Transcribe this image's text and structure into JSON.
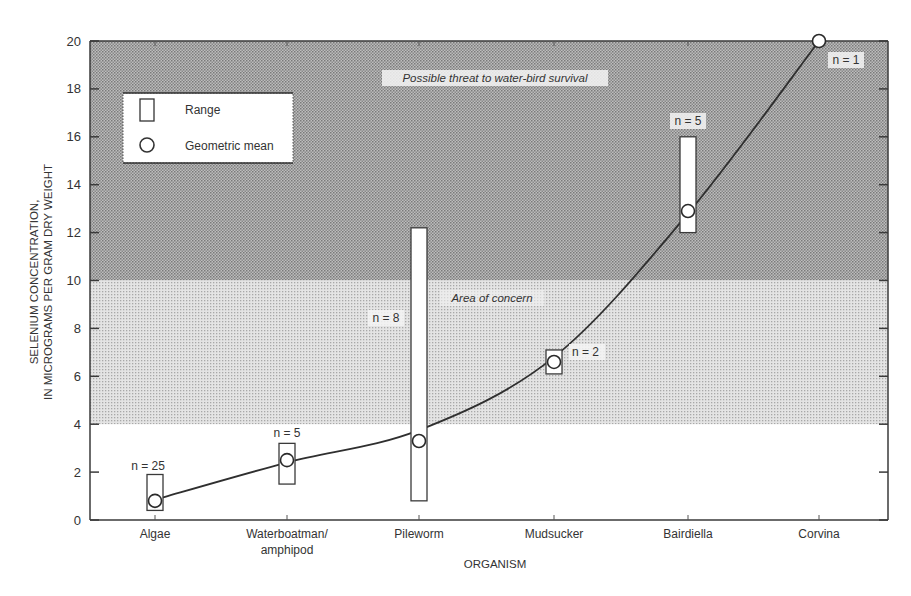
{
  "chart_data": {
    "type": "scatter",
    "title": "",
    "xlabel": "ORGANISM",
    "ylabel_line1": "SELENIUM CONCENTRATION,",
    "ylabel_line2": "IN MICROGRAMS PER GRAM DRY WEIGHT",
    "ylim": [
      0,
      20
    ],
    "yticks": [
      0,
      2,
      4,
      6,
      8,
      10,
      12,
      14,
      16,
      18,
      20
    ],
    "grid": false,
    "categories": [
      "Algae",
      "Waterboatman/\namphipod",
      "Pileworm",
      "Mudsucker",
      "Bairdiella",
      "Corvina"
    ],
    "category_labels": [
      [
        "Algae"
      ],
      [
        "Waterboatman/",
        "amphipod"
      ],
      [
        "Pileworm"
      ],
      [
        "Mudsucker"
      ],
      [
        "Bairdiella"
      ],
      [
        "Corvina"
      ]
    ],
    "series": [
      {
        "name": "Geometric mean",
        "marker": "circle",
        "values": [
          0.8,
          2.5,
          3.3,
          6.6,
          12.9,
          20
        ]
      },
      {
        "name": "Range",
        "marker": "rectangle",
        "low": [
          0.4,
          1.5,
          0.8,
          6.1,
          12.0,
          null
        ],
        "high": [
          1.9,
          3.2,
          12.2,
          7.1,
          16.0,
          null
        ]
      }
    ],
    "sample_sizes": [
      "n = 25",
      "n = 5",
      "n = 8",
      "n = 2",
      "n = 5",
      "n = 1"
    ],
    "trend_curve": {
      "description": "smooth fitted curve through geometric means",
      "points": [
        [
          0,
          0.85
        ],
        [
          1,
          2.4
        ],
        [
          2,
          3.75
        ],
        [
          3,
          6.8
        ],
        [
          4,
          12.8
        ],
        [
          5,
          20
        ]
      ]
    },
    "shaded_regions": [
      {
        "label": "Possible threat to water-bird survival",
        "ymin": 10,
        "ymax": 20,
        "shade": "dark"
      },
      {
        "label": "Area of concern",
        "ymin": 4,
        "ymax": 10,
        "shade": "light"
      }
    ],
    "legend": {
      "position": "upper-left",
      "entries": [
        "Range",
        "Geometric mean"
      ]
    }
  }
}
